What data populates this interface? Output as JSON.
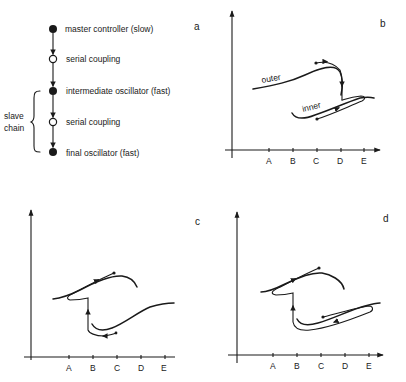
{
  "panel_a": {
    "label": "a",
    "nodes": [
      {
        "text": "master controller (slow)",
        "type": "filled"
      },
      {
        "text": "serial coupling",
        "type": "open"
      },
      {
        "text": "intermediate oscillator (fast)",
        "type": "filled"
      },
      {
        "text": "serial coupling",
        "type": "open"
      },
      {
        "text": "final oscillator (fast)",
        "type": "filled"
      }
    ],
    "bracket_label_line1": "slave",
    "bracket_label_line2": "chain"
  },
  "panel_b": {
    "label": "b",
    "curve_label_outer": "outer",
    "curve_label_inner": "inner",
    "ticks": [
      "A",
      "B",
      "C",
      "D",
      "E"
    ]
  },
  "panel_c": {
    "label": "c",
    "ticks": [
      "A",
      "B",
      "C",
      "D",
      "E"
    ]
  },
  "panel_d": {
    "label": "d",
    "ticks": [
      "A",
      "B",
      "C",
      "D",
      "E"
    ]
  },
  "colors": {
    "ink": "#1a1a1a",
    "background": "#ffffff"
  }
}
